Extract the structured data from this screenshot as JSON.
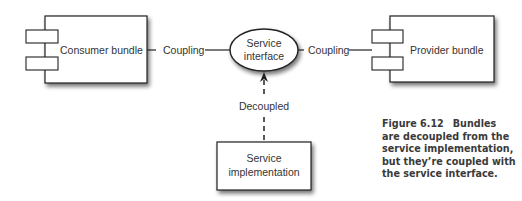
{
  "diagram": {
    "nodes": {
      "consumer": {
        "label": "Consumer bundle"
      },
      "provider": {
        "label": "Provider bundle"
      },
      "interface": {
        "line1": "Service",
        "line2": "interface"
      },
      "implementation": {
        "line1": "Service",
        "line2": "implementation"
      }
    },
    "edges": {
      "left": {
        "label": "Coupling"
      },
      "right": {
        "label": "Coupling"
      },
      "down": {
        "label": "Decoupled"
      }
    }
  },
  "caption": {
    "figure": "Figure 6.12",
    "text": "Bundles are decoupled from the service implementation, but they’re coupled with the service interface."
  },
  "colors": {
    "stroke": "#222222",
    "text": "#333333",
    "shadow": "#888888"
  }
}
